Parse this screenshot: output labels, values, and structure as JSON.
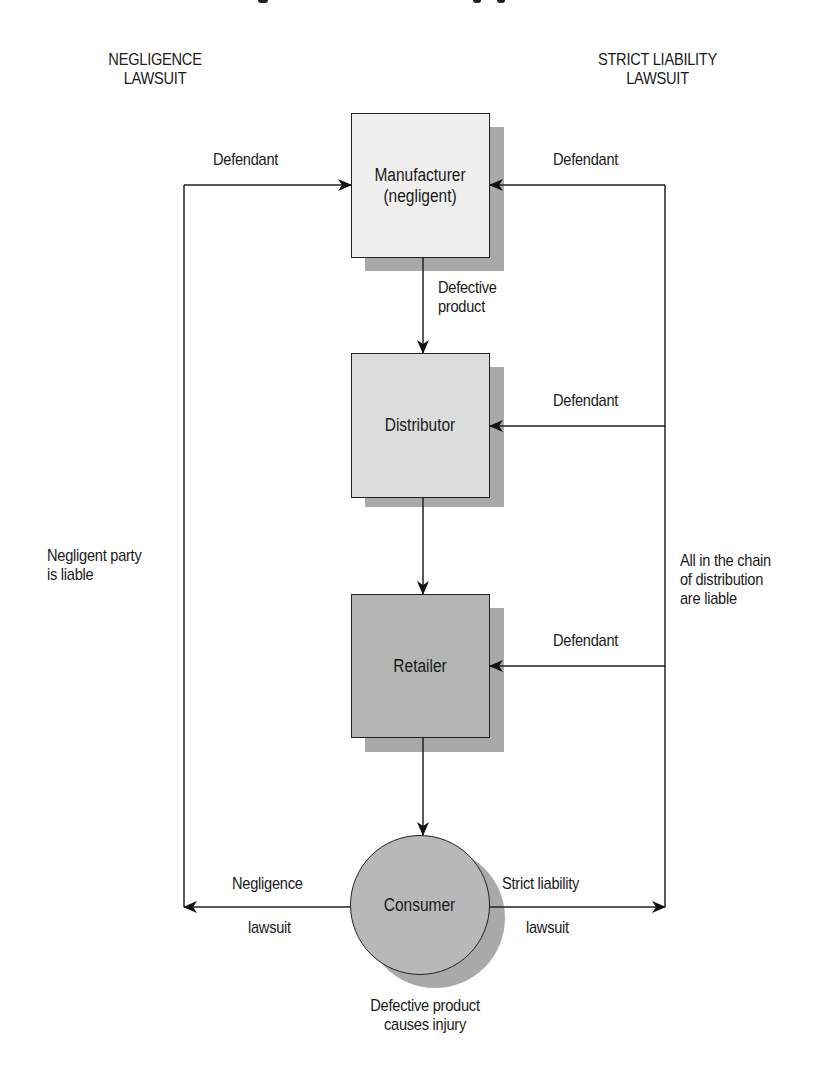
{
  "headers": {
    "left": [
      "NEGLIGENCE",
      "LAWSUIT"
    ],
    "right": [
      "STRICT LIABILITY",
      "LAWSUIT"
    ]
  },
  "nodes": {
    "manufacturer": {
      "lines": [
        "Manufacturer",
        "(negligent)"
      ],
      "fill": "#efefef"
    },
    "distributor": {
      "lines": [
        "Distributor"
      ],
      "fill": "#dcdcdc"
    },
    "retailer": {
      "lines": [
        "Retailer"
      ],
      "fill": "#b4b4b4"
    },
    "consumer": {
      "lines": [
        "Consumer"
      ],
      "fill": "#b8b8b8"
    }
  },
  "edge_labels": {
    "defendant_left_top": "Defendant",
    "defendant_right_top": "Defendant",
    "defendant_right_distributor": "Defendant",
    "defendant_right_retailer": "Defendant",
    "defective_product": [
      "Defective",
      "product"
    ],
    "negligence_lawsuit": [
      "Negligence",
      "lawsuit"
    ],
    "strict_liability_lawsuit": [
      "Strict liability",
      "lawsuit"
    ],
    "consumer_caption": [
      "Defective product",
      "causes injury"
    ]
  },
  "side_notes": {
    "left": [
      "Negligent party",
      "is liable"
    ],
    "right": [
      "All in the chain",
      "of distribution",
      "are liable"
    ]
  },
  "colors": {
    "line": "#222222",
    "shadow": "#a9a9a9",
    "background": "#ffffff"
  }
}
